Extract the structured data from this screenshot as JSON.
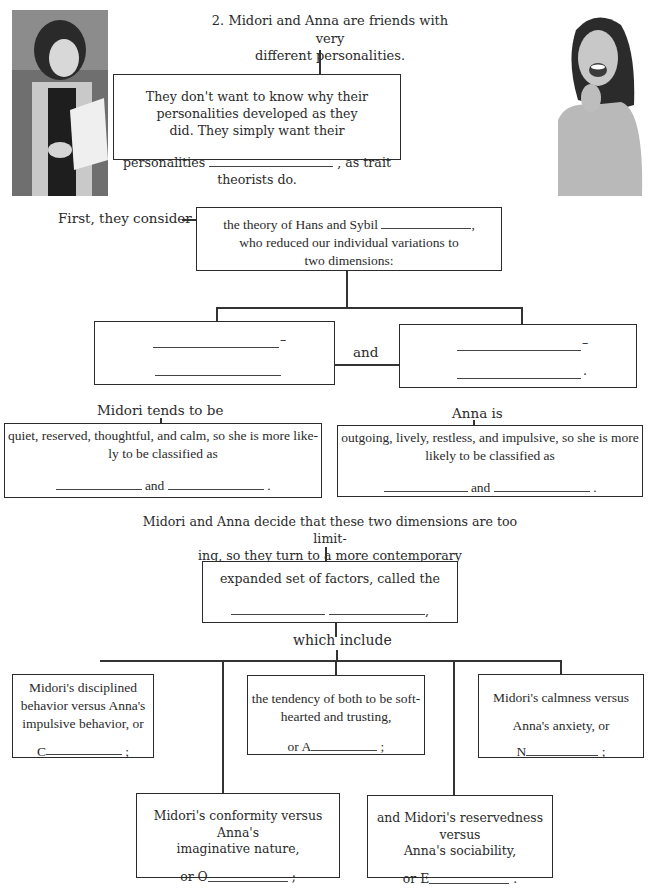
{
  "header_fragment": "",
  "photos": {
    "left": {
      "alt": "Midori reading papers outdoors"
    },
    "right": {
      "alt": "Anna laughing"
    }
  },
  "intro": {
    "line1": "2. Midori and Anna are friends with very",
    "line2": "different personalities."
  },
  "box_trait": {
    "line1": "They don't want to know why their personalities developed as they",
    "line2": "did. They simply want their",
    "line3_before": "personalities",
    "line3_after": ", as trait theorists do."
  },
  "first_label": "First, they consider",
  "box_eysenck": {
    "line1_before": "the theory of Hans and Sybil",
    "line1_after": ",",
    "line2": "who reduced our individual variations to",
    "line3": "two dimensions:"
  },
  "dimension_left": {
    "dash": "–",
    "end": ""
  },
  "dimension_right": {
    "dash": "–",
    "end": "."
  },
  "and_label": "and",
  "midori_label": "Midori tends to be",
  "anna_label": "Anna is",
  "box_midori": {
    "line1": "quiet, reserved, thoughtful, and calm, so she is more like-",
    "line2": "ly to be classified as",
    "and": "and",
    "end": "."
  },
  "box_anna": {
    "line1": "outgoing, lively, restless, and impulsive, so she is more",
    "line2": "likely to be classified as",
    "and": "and",
    "end": "."
  },
  "decide": {
    "line1": "Midori and Anna decide that these two dimensions are too limit-",
    "line2": "ing, so they turn to a more contemporary"
  },
  "box_expanded": {
    "line1": "expanded set of factors, called the",
    "end": ","
  },
  "which_include": "which include",
  "factors": [
    {
      "lines": [
        "Midori's disciplined",
        "behavior versus Anna's",
        "impulsive behavior, or"
      ],
      "prefix": "C",
      "end": ";"
    },
    {
      "lines": [
        "the tendency of both to be soft-",
        "hearted and trusting,"
      ],
      "prefix": "or A",
      "end": ";"
    },
    {
      "lines": [
        "Midori's calmness versus",
        "Anna's anxiety, or"
      ],
      "prefix": "N",
      "end": ";"
    },
    {
      "lines": [
        "Midori's conformity versus Anna's",
        "imaginative nature,"
      ],
      "prefix": "or O",
      "end": ";"
    },
    {
      "lines": [
        "and Midori's reservedness versus",
        "Anna's sociability,"
      ],
      "prefix": "or E",
      "end": "."
    }
  ]
}
